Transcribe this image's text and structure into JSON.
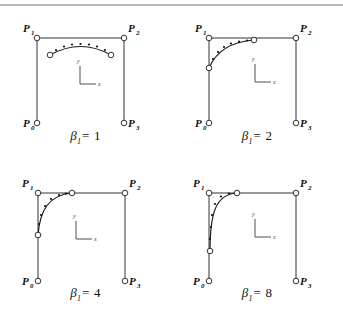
{
  "figure": {
    "type": "diagram",
    "background_color": "#ffffff",
    "line_color": "#333333",
    "rule_color": "#b9b9b9",
    "marker_fill": "#ffffff",
    "marker_stroke": "#333333",
    "curve_color": "#1a1a1a"
  },
  "axis_indicator": {
    "y_label": "y",
    "x_label": "x"
  },
  "panels": [
    {
      "id": "panel-beta-1",
      "caption_symbol": "β",
      "caption_subscript": "1",
      "caption_equals": "=",
      "caption_value": "1",
      "caption_full": "β₁ = 1",
      "beta": 1,
      "control_points": [
        {
          "name": "P0",
          "label": "P",
          "subscript": "0",
          "x": 37,
          "y": 115
        },
        {
          "name": "P1",
          "label": "P",
          "subscript": "1",
          "x": 37,
          "y": 30
        },
        {
          "name": "P2",
          "label": "P",
          "subscript": "2",
          "x": 124,
          "y": 30
        },
        {
          "name": "P3",
          "label": "P",
          "subscript": "3",
          "x": 124,
          "y": 115
        }
      ],
      "curve_endpoints": [
        {
          "x": 50,
          "y": 47
        },
        {
          "x": 111,
          "y": 47
        }
      ],
      "curve_path": "M 50 47 Q 80.5 30 111 47",
      "curve_dots": [
        {
          "x": 56,
          "y": 42
        },
        {
          "x": 64,
          "y": 38.5
        },
        {
          "x": 72,
          "y": 36.5
        },
        {
          "x": 80.5,
          "y": 36
        },
        {
          "x": 89,
          "y": 36.5
        },
        {
          "x": 97,
          "y": 38.5
        },
        {
          "x": 105,
          "y": 42
        }
      ]
    },
    {
      "id": "panel-beta-2",
      "caption_symbol": "β",
      "caption_subscript": "1",
      "caption_equals": "=",
      "caption_value": "2",
      "caption_full": "β₁ = 2",
      "beta": 2,
      "control_points": [
        {
          "name": "P0",
          "label": "P",
          "subscript": "0",
          "x": 38,
          "y": 115
        },
        {
          "name": "P1",
          "label": "P",
          "subscript": "1",
          "x": 38,
          "y": 30
        },
        {
          "name": "P2",
          "label": "P",
          "subscript": "2",
          "x": 125,
          "y": 30
        },
        {
          "name": "P3",
          "label": "P",
          "subscript": "3",
          "x": 125,
          "y": 115
        }
      ],
      "curve_endpoints": [
        {
          "x": 38,
          "y": 60
        },
        {
          "x": 83,
          "y": 32
        }
      ],
      "curve_path": "M 38 60 C 44 46 56 34 83 32",
      "curve_dots": [
        {
          "x": 42,
          "y": 51
        },
        {
          "x": 47,
          "y": 44
        },
        {
          "x": 53,
          "y": 39
        },
        {
          "x": 60,
          "y": 35.5
        },
        {
          "x": 68,
          "y": 33.5
        },
        {
          "x": 76,
          "y": 32.5
        }
      ]
    },
    {
      "id": "panel-beta-4",
      "caption_symbol": "β",
      "caption_subscript": "1",
      "caption_equals": "=",
      "caption_value": "4",
      "caption_full": "β₁ = 4",
      "beta": 4,
      "control_points": [
        {
          "name": "P0",
          "label": "P",
          "subscript": "0",
          "x": 38,
          "y": 118
        },
        {
          "name": "P1",
          "label": "P",
          "subscript": "1",
          "x": 38,
          "y": 30
        },
        {
          "name": "P2",
          "label": "P",
          "subscript": "2",
          "x": 125,
          "y": 30
        },
        {
          "name": "P3",
          "label": "P",
          "subscript": "3",
          "x": 125,
          "y": 118
        }
      ],
      "curve_endpoints": [
        {
          "x": 38,
          "y": 72
        },
        {
          "x": 72,
          "y": 30
        }
      ],
      "curve_path": "M 38 72 C 40 48 48 32 72 30",
      "curve_dots": [
        {
          "x": 39,
          "y": 61
        },
        {
          "x": 41,
          "y": 52
        },
        {
          "x": 45,
          "y": 43
        },
        {
          "x": 51,
          "y": 36
        },
        {
          "x": 59,
          "y": 32
        },
        {
          "x": 66,
          "y": 30.5
        }
      ]
    },
    {
      "id": "panel-beta-8",
      "caption_symbol": "β",
      "caption_subscript": "1",
      "caption_equals": "=",
      "caption_value": "8",
      "caption_full": "β₁ = 8",
      "beta": 8,
      "control_points": [
        {
          "name": "P0",
          "label": "P",
          "subscript": "0",
          "x": 38,
          "y": 118
        },
        {
          "name": "P1",
          "label": "P",
          "subscript": "1",
          "x": 38,
          "y": 30
        },
        {
          "name": "P2",
          "label": "P",
          "subscript": "2",
          "x": 125,
          "y": 30
        },
        {
          "name": "P3",
          "label": "P",
          "subscript": "3",
          "x": 125,
          "y": 118
        }
      ],
      "curve_endpoints": [
        {
          "x": 39,
          "y": 88
        },
        {
          "x": 66,
          "y": 30
        }
      ],
      "curve_path": "M 39 88 C 39 52 44 31 66 30",
      "curve_dots": [
        {
          "x": 39,
          "y": 76
        },
        {
          "x": 40,
          "y": 64
        },
        {
          "x": 41,
          "y": 52
        },
        {
          "x": 44,
          "y": 41
        },
        {
          "x": 50,
          "y": 33.5
        },
        {
          "x": 58,
          "y": 30.5
        }
      ]
    }
  ]
}
